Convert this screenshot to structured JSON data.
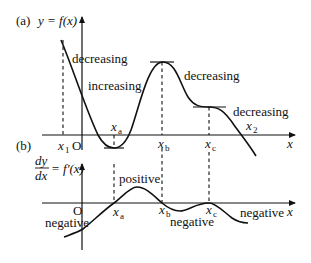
{
  "panel_a": {
    "tag": "(a)",
    "y_label": "y = f(x)",
    "x_axis_label": "x",
    "origin_label": "O",
    "points": {
      "x1": {
        "base": "x",
        "sub": "1"
      },
      "xa": {
        "base": "x",
        "sub": "a"
      },
      "xb": {
        "base": "x",
        "sub": "b"
      },
      "xc": {
        "base": "x",
        "sub": "c"
      },
      "x2": {
        "base": "x",
        "sub": "2"
      }
    },
    "annotations": {
      "decreasing_1": "decreasing",
      "increasing": "increasing",
      "decreasing_2": "decreasing",
      "decreasing_3": "decreasing"
    }
  },
  "panel_b": {
    "tag": "(b)",
    "y_label_num": "dy",
    "y_label_den": "dx",
    "y_label_rest": "= f′(x)",
    "x_axis_label": "x",
    "origin_label": "O",
    "points": {
      "xa": {
        "base": "x",
        "sub": "a"
      },
      "xb": {
        "base": "x",
        "sub": "b"
      },
      "xc": {
        "base": "x",
        "sub": "c"
      }
    },
    "annotations": {
      "negative_1": "negative",
      "positive": "positive",
      "negative_2": "negative",
      "negative_3": "negative"
    }
  }
}
